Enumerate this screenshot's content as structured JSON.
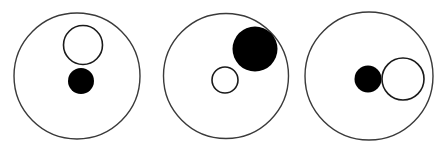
{
  "figure": {
    "width": 447,
    "height": 151,
    "background_color": "#ffffff",
    "outline_color": "#3a3a3a",
    "fill_color": "#000000",
    "hollow_fill_color": "#ffffff"
  },
  "chart_data": {
    "type": "scatter",
    "xlabel": "",
    "ylabel": "",
    "xlim": [
      0,
      447
    ],
    "ylim": [
      0,
      151
    ],
    "grid": false,
    "legend": "none",
    "groups": [
      {
        "name": "group-1",
        "outer": {
          "name": "outer-circle",
          "cx": 77,
          "cy": 76,
          "r": 63,
          "fill": "none",
          "stroke": "#3a3a3a",
          "stroke_width": 1.4
        },
        "inner": [
          {
            "name": "hollow-circle",
            "style": "hollow",
            "cx": 83,
            "cy": 45,
            "r": 19.5,
            "fill": "#ffffff",
            "stroke": "#1a1a1a",
            "stroke_width": 1.6
          },
          {
            "name": "filled-circle",
            "style": "filled",
            "cx": 81,
            "cy": 81,
            "r": 13,
            "fill": "#000000",
            "stroke": "none",
            "stroke_width": 0
          }
        ]
      },
      {
        "name": "group-2",
        "outer": {
          "name": "outer-circle",
          "cx": 226,
          "cy": 76,
          "r": 62.5,
          "fill": "none",
          "stroke": "#3a3a3a",
          "stroke_width": 1.4
        },
        "inner": [
          {
            "name": "filled-circle",
            "style": "filled",
            "cx": 255,
            "cy": 49,
            "r": 22.5,
            "fill": "#000000",
            "stroke": "none",
            "stroke_width": 0
          },
          {
            "name": "hollow-circle",
            "style": "hollow",
            "cx": 225,
            "cy": 80,
            "r": 13,
            "fill": "#ffffff",
            "stroke": "#1a1a1a",
            "stroke_width": 1.6
          }
        ]
      },
      {
        "name": "group-3",
        "outer": {
          "name": "outer-circle",
          "cx": 369,
          "cy": 76,
          "r": 64,
          "fill": "none",
          "stroke": "#3a3a3a",
          "stroke_width": 1.4
        },
        "inner": [
          {
            "name": "filled-circle",
            "style": "filled",
            "cx": 368,
            "cy": 79,
            "r": 13.5,
            "fill": "#000000",
            "stroke": "none",
            "stroke_width": 0
          },
          {
            "name": "hollow-circle",
            "style": "hollow",
            "cx": 403,
            "cy": 79,
            "r": 21,
            "fill": "#ffffff",
            "stroke": "#1a1a1a",
            "stroke_width": 1.6
          }
        ]
      }
    ]
  }
}
